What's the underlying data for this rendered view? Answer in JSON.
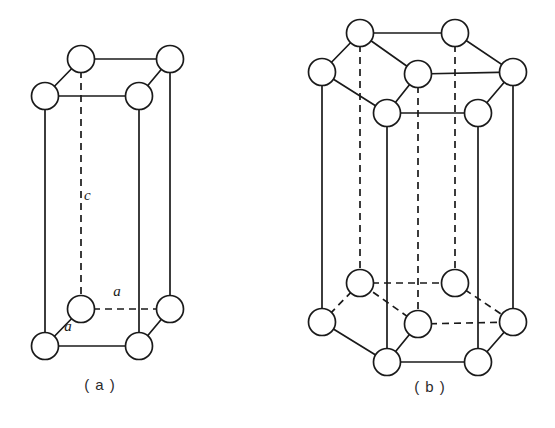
{
  "figure": {
    "background_color": "#ffffff",
    "line_color": "#1a1a1a",
    "atom_fill_color": "#ffffff",
    "atom_radius": 13.5,
    "panels": [
      {
        "id": "a",
        "caption": "( a )",
        "caption_x": 100,
        "caption_y": 390,
        "description": "simple hexagonal primitive cell",
        "labels": [
          {
            "text": "c",
            "x": 84,
            "y": 200
          },
          {
            "text": "a",
            "x": 117,
            "y": 296
          },
          {
            "text": "a",
            "x": 68,
            "y": 331
          }
        ],
        "vertices": {
          "top_back_left": {
            "x": 81,
            "y": 59
          },
          "top_back_right": {
            "x": 170,
            "y": 59
          },
          "top_front_left": {
            "x": 45,
            "y": 96
          },
          "top_front_right": {
            "x": 139,
            "y": 96
          },
          "bot_back_left": {
            "x": 81,
            "y": 309
          },
          "bot_back_right": {
            "x": 170,
            "y": 309
          },
          "bot_front_left": {
            "x": 45,
            "y": 346
          },
          "bot_front_right": {
            "x": 139,
            "y": 346
          }
        },
        "atom_count": 8
      },
      {
        "id": "b",
        "caption": "( b )",
        "caption_x": 430,
        "caption_y": 392,
        "description": "full hexagonal prism cell with centre atoms",
        "labels": [],
        "vertices": {
          "top_back_left": {
            "x": 360,
            "y": 33
          },
          "top_back_right": {
            "x": 455,
            "y": 33
          },
          "top_left": {
            "x": 322,
            "y": 72
          },
          "top_right": {
            "x": 513,
            "y": 72
          },
          "top_front_left": {
            "x": 387,
            "y": 113
          },
          "top_front_right": {
            "x": 478,
            "y": 113
          },
          "top_center": {
            "x": 418,
            "y": 74
          },
          "bot_back_left": {
            "x": 360,
            "y": 283
          },
          "bot_back_right": {
            "x": 455,
            "y": 283
          },
          "bot_left": {
            "x": 322,
            "y": 322
          },
          "bot_right": {
            "x": 513,
            "y": 322
          },
          "bot_front_left": {
            "x": 387,
            "y": 362
          },
          "bot_front_right": {
            "x": 478,
            "y": 362
          },
          "bot_center": {
            "x": 418,
            "y": 324
          }
        },
        "atom_count": 14
      }
    ]
  }
}
